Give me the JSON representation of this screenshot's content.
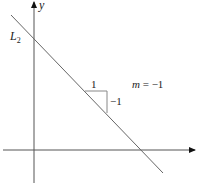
{
  "diagram": {
    "axes": {
      "x_label": "",
      "y_label": "y",
      "color": "#555555"
    },
    "line": {
      "name_base": "L",
      "name_sub": "2",
      "color": "#666666"
    },
    "slope_triangle": {
      "run_label": "1",
      "rise_label": "−1"
    },
    "slope_annotation": {
      "var": "m",
      "eq": " = −1"
    }
  }
}
